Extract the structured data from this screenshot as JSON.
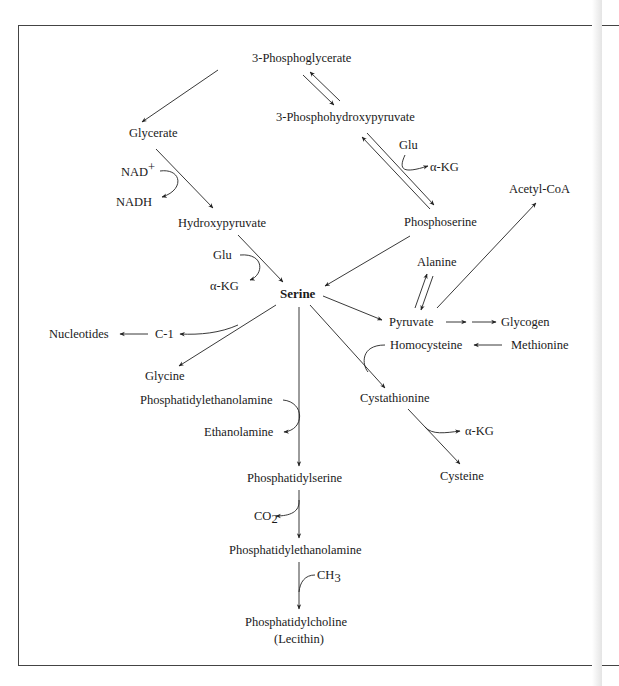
{
  "diagram": {
    "central": "Serine",
    "nodes": {
      "phosphoglycerate": "3-Phosphoglycerate",
      "glycerate": "Glycerate",
      "phosphohydroxypyruvate": "3-Phosphohydroxypyruvate",
      "nad_plus": "NAD",
      "nad_plus_sup": "+",
      "nadh": "NADH",
      "glu_top": "Glu",
      "akg_top": "α-KG",
      "acetyl_coa": "Acetyl-CoA",
      "hydroxypyruvate": "Hydroxypyruvate",
      "phosphoserine": "Phosphoserine",
      "glu_left": "Glu",
      "akg_left": "α-KG",
      "alanine": "Alanine",
      "serine": "Serine",
      "nucleotides": "Nucleotides",
      "c1": "C-1",
      "pyruvate": "Pyruvate",
      "glycogen": "Glycogen",
      "homocysteine": "Homocysteine",
      "methionine": "Methionine",
      "glycine": "Glycine",
      "pe_top": "Phosphatidylethanolamine",
      "ethanolamine": "Ethanolamine",
      "cystathionine": "Cystathionine",
      "akg_right": "α-KG",
      "cysteine": "Cysteine",
      "phosphatidylserine": "Phosphatidylserine",
      "co2": "CO",
      "co2_sub": "2",
      "pe_bottom": "Phosphatidylethanolamine",
      "ch3": "CH",
      "ch3_sub": "3",
      "phosphatidylcholine": "Phosphatidylcholine",
      "lecithin": "(Lecithin)"
    },
    "edges": [
      {
        "from": "3-Phosphoglycerate",
        "to": "Glycerate",
        "type": "irreversible"
      },
      {
        "from": "3-Phosphoglycerate",
        "to": "3-Phosphohydroxypyruvate",
        "type": "reversible"
      },
      {
        "from": "Glycerate",
        "to": "Hydroxypyruvate",
        "type": "irreversible",
        "cofactor": "NAD+ → NADH"
      },
      {
        "from": "3-Phosphohydroxypyruvate",
        "to": "Phosphoserine",
        "type": "reversible",
        "cofactor": "Glu → α-KG"
      },
      {
        "from": "Hydroxypyruvate",
        "to": "Serine",
        "type": "irreversible",
        "cofactor": "Glu → α-KG"
      },
      {
        "from": "Phosphoserine",
        "to": "Serine",
        "type": "irreversible"
      },
      {
        "from": "Serine",
        "to": "Pyruvate",
        "type": "irreversible"
      },
      {
        "from": "Alanine",
        "to": "Pyruvate",
        "type": "reversible"
      },
      {
        "from": "Pyruvate",
        "to": "Acetyl-CoA",
        "type": "irreversible"
      },
      {
        "from": "Pyruvate",
        "to": "Glycogen",
        "type": "multi-step"
      },
      {
        "from": "Methionine",
        "to": "Homocysteine",
        "type": "irreversible"
      },
      {
        "from": "Serine",
        "to": "Cystathionine",
        "type": "irreversible",
        "cofactor": "Homocysteine"
      },
      {
        "from": "Cystathionine",
        "to": "Cysteine",
        "type": "irreversible",
        "cofactor": "→ α-KG"
      },
      {
        "from": "Serine",
        "to": "Glycine",
        "type": "irreversible",
        "cofactor": "→ C-1"
      },
      {
        "from": "C-1",
        "to": "Nucleotides",
        "type": "irreversible"
      },
      {
        "from": "Serine",
        "to": "Phosphatidylserine",
        "type": "irreversible",
        "cofactor": "Phosphatidylethanolamine → Ethanolamine"
      },
      {
        "from": "Phosphatidylserine",
        "to": "Phosphatidylethanolamine",
        "type": "irreversible",
        "cofactor": "→ CO2"
      },
      {
        "from": "Phosphatidylethanolamine",
        "to": "Phosphatidylcholine (Lecithin)",
        "type": "irreversible",
        "cofactor": "CH3"
      }
    ]
  }
}
